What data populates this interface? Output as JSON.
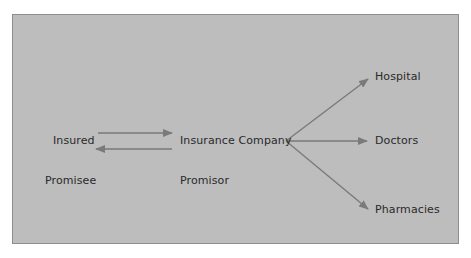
{
  "diagram": {
    "nodes": {
      "insured": "Insured",
      "insurance_company": "Insurance Company",
      "hospital": "Hospital",
      "doctors": "Doctors",
      "pharmacies": "Pharmacies"
    },
    "roles": {
      "promisee": "Promisee",
      "promisor": "Promisor"
    },
    "edges": [
      {
        "from": "Insured",
        "to": "Insurance Company"
      },
      {
        "from": "Insurance Company",
        "to": "Insured"
      },
      {
        "from": "Insurance Company",
        "to": "Hospital"
      },
      {
        "from": "Insurance Company",
        "to": "Doctors"
      },
      {
        "from": "Insurance Company",
        "to": "Pharmacies"
      }
    ],
    "colors": {
      "background": "#bdbdbd",
      "border": "#8e8e8e",
      "arrow": "#7a7a7a",
      "text": "#2a2a2a"
    }
  }
}
